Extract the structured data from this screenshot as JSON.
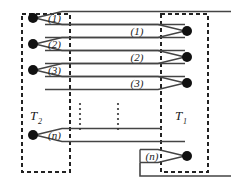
{
  "figure": {
    "type": "signal-routing-diagram",
    "stroke_color": "#333333",
    "node_color": "#111111",
    "background": "#ffffff",
    "blocks": [
      {
        "id": "T2",
        "label": "T",
        "subscript": "2",
        "side": "left",
        "x": 22,
        "y": 14,
        "width": 48,
        "height": 158
      },
      {
        "id": "T1",
        "label": "T",
        "subscript": "1",
        "side": "right",
        "x": 161,
        "y": 14,
        "width": 47,
        "height": 158
      }
    ],
    "block_labels": [
      {
        "id": "T2-label",
        "text": "T",
        "sub": "2",
        "x": 32,
        "y": 117
      },
      {
        "id": "T1-label",
        "text": "T",
        "sub": "1",
        "x": 177,
        "y": 117
      }
    ],
    "channels": [
      {
        "index": 1,
        "left_label": "(1)",
        "right_label": "(1)",
        "left_y": 18,
        "right_y": 31
      },
      {
        "index": 2,
        "left_label": "(2)",
        "right_label": "(2)",
        "left_y": 44,
        "right_y": 57
      },
      {
        "index": 3,
        "left_label": "(3)",
        "right_label": "(3)",
        "left_y": 70,
        "right_y": 83
      },
      {
        "index": 4,
        "left_label": "(n)",
        "right_label": "(n)",
        "left_y": 135,
        "right_y": 156
      }
    ],
    "labels": {
      "left_channel_1": "(1)",
      "left_channel_2": "(2)",
      "left_channel_3": "(3)",
      "left_channel_n": "(n)",
      "right_channel_1": "(1)",
      "right_channel_2": "(2)",
      "right_channel_3": "(3)",
      "right_channel_n": "(n)",
      "terminal_left": "T",
      "terminal_left_sub": "2",
      "terminal_right": "T",
      "terminal_right_sub": "1"
    },
    "ellipsis": {
      "symbol": "vertical-dots",
      "columns": [
        {
          "x": 80,
          "y_start": 104,
          "y_end": 130
        },
        {
          "x": 118,
          "y_start": 104,
          "y_end": 130
        }
      ]
    },
    "external_lines": [
      {
        "id": "top-outgoing",
        "from_x": 185,
        "from_y": 18,
        "to_x": 231,
        "to_y": 18
      },
      {
        "id": "bottom-feedback",
        "points": "152,156 140,156 140,176 231,176"
      }
    ]
  }
}
